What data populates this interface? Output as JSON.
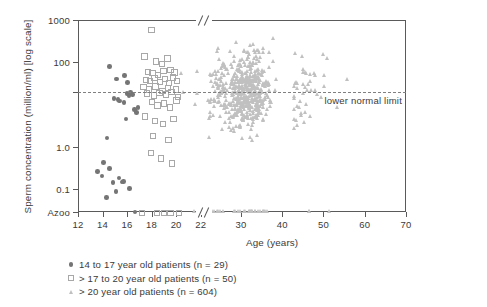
{
  "chart_data": {
    "type": "scatter",
    "title": "",
    "xlabel": "Age (years)",
    "ylabel": "Sperm concentration (million/ml) [log scale]",
    "xlim": [
      12,
      70
    ],
    "ylim_log": [
      -1.7,
      3
    ],
    "x_ticks": [
      12,
      14,
      16,
      18,
      20,
      22,
      30,
      40,
      50,
      60,
      70
    ],
    "x_tick_labels": [
      "12",
      "14",
      "16",
      "18",
      "20",
      "22",
      "30",
      "40",
      "50",
      "60",
      "70"
    ],
    "x_axis_break": {
      "after": 22,
      "before": 30,
      "note": "scale change"
    },
    "y_ticks": [
      1000,
      100,
      1.0,
      0.1,
      "Azoo"
    ],
    "y_tick_labels": [
      "1000",
      "100",
      "1.0",
      "0.1",
      "Azoo"
    ],
    "grid": false,
    "legend_position": "below-left",
    "reference_line": {
      "value": 20,
      "label": "lower normal limit",
      "style": "dashed",
      "color": "#808080"
    },
    "series": [
      {
        "name": "14 to 17 year old patients (n = 29)",
        "marker": "filled-circle",
        "color": "#757575",
        "n": 29,
        "points": [
          [
            14.55,
            80
          ],
          [
            15.15,
            40
          ],
          [
            15.8,
            48
          ],
          [
            16.05,
            33
          ],
          [
            14.35,
            1.6
          ],
          [
            15.4,
            12
          ],
          [
            14.95,
            14
          ],
          [
            15.25,
            13
          ],
          [
            15.75,
            11
          ],
          [
            16.0,
            18
          ],
          [
            16.15,
            16
          ],
          [
            16.3,
            19
          ],
          [
            16.45,
            17
          ],
          [
            16.6,
            7.5
          ],
          [
            16.75,
            6.5
          ],
          [
            16.9,
            8.5
          ],
          [
            15.9,
            4.5
          ],
          [
            14.1,
            0.42
          ],
          [
            14.55,
            0.3
          ],
          [
            15.35,
            0.18
          ],
          [
            15.1,
            0.085
          ],
          [
            13.6,
            0.26
          ],
          [
            13.95,
            0.2
          ],
          [
            14.85,
            0.14
          ],
          [
            15.6,
            0.145
          ],
          [
            15.7,
            0.15
          ],
          [
            16.2,
            0.1
          ],
          [
            14.3,
            0.062
          ],
          [
            16.65,
            0.055
          ]
        ]
      },
      {
        "name": "> 17 to 20 year old patients (n = 50)",
        "marker": "open-square",
        "color": "#a8a8a8",
        "n": 50,
        "points": [
          [
            17.9,
            620
          ],
          [
            17.35,
            145
          ],
          [
            18.3,
            110
          ],
          [
            18.75,
            95
          ],
          [
            19.2,
            130
          ],
          [
            17.6,
            62
          ],
          [
            18.0,
            58
          ],
          [
            18.45,
            52
          ],
          [
            18.9,
            66
          ],
          [
            19.45,
            70
          ],
          [
            19.8,
            60
          ],
          [
            17.45,
            40
          ],
          [
            17.8,
            38
          ],
          [
            18.15,
            44
          ],
          [
            18.6,
            36
          ],
          [
            19.0,
            42
          ],
          [
            19.35,
            34
          ],
          [
            19.65,
            46
          ],
          [
            20.0,
            38
          ],
          [
            17.25,
            27
          ],
          [
            17.7,
            24
          ],
          [
            18.25,
            28
          ],
          [
            18.8,
            22
          ],
          [
            19.25,
            26
          ],
          [
            19.9,
            24
          ],
          [
            17.55,
            19
          ],
          [
            18.1,
            17
          ],
          [
            18.55,
            20
          ],
          [
            19.1,
            18
          ],
          [
            19.55,
            21
          ],
          [
            20.05,
            16
          ],
          [
            17.95,
            12
          ],
          [
            18.4,
            10
          ],
          [
            18.95,
            11
          ],
          [
            19.4,
            9
          ],
          [
            19.95,
            13
          ],
          [
            17.4,
            5.5
          ],
          [
            18.2,
            4.2
          ],
          [
            18.85,
            3.6
          ],
          [
            19.7,
            4.8
          ],
          [
            18.05,
            1.9
          ],
          [
            19.3,
            1.5
          ],
          [
            17.85,
            0.75
          ],
          [
            18.7,
            0.55
          ],
          [
            19.6,
            0.42
          ],
          [
            17.15,
            0.055
          ],
          [
            18.35,
            0.055
          ],
          [
            18.95,
            0.055
          ],
          [
            19.45,
            0.055
          ],
          [
            20.15,
            0.055
          ]
        ]
      },
      {
        "name": "> 20 year old patients (n = 604)",
        "marker": "open-triangle",
        "color": "#c0c0c0",
        "n": 604,
        "density_note": "Dense cloud centred on ages 25-38, concentrations 3-200 million/ml; sparse tail out to age 63; azoospermic points along the baseline."
      }
    ]
  }
}
